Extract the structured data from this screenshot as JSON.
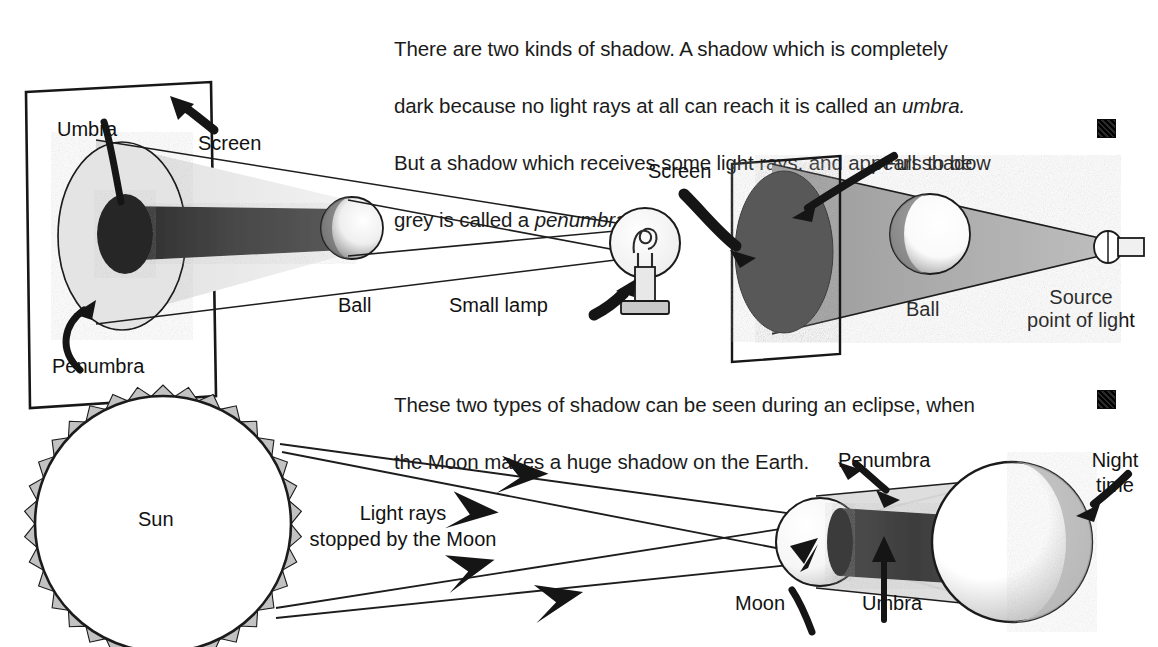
{
  "document": {
    "title": "There are two kinds of shadow — umbra and penumbra",
    "background_color": "#ffffff",
    "ink_color": "#111111"
  },
  "paragraphs": [
    {
      "id": "intro",
      "text": "There are two kinds of shadow. A shadow which is completely\ndark because no light rays at all can reach it is called an umbra.\nBut a shadow which receives some light rays, and appears to be\ngrey is called a penumbra.",
      "italic_terms": [
        "umbra.",
        "penumbra."
      ]
    },
    {
      "id": "eclipse",
      "text": "These two types of shadow can be seen during an eclipse, when\nthe Moon makes a huge shadow on the Earth."
    }
  ],
  "markers": [
    {
      "id": "marker-1",
      "shape": "filled-square"
    },
    {
      "id": "marker-2",
      "shape": "filled-square"
    }
  ],
  "figures": [
    {
      "id": "extended-source-figure",
      "caption_concept": "Extended light source (small lamp) creates umbra and penumbra",
      "labels": {
        "umbra": "Umbra",
        "penumbra": "Penumbra",
        "screen": "Screen",
        "ball": "Ball",
        "lamp": "Small lamp"
      },
      "colors": {
        "penumbra_fill": "#d7d7d7",
        "umbra_fill": "#4c4c4c",
        "umbra_core": "#2b2b2b",
        "ball_fill": "#efefef",
        "outline": "#1a1a1a"
      }
    },
    {
      "id": "point-source-figure",
      "caption_concept": "Point source of light creates only a full (dark) shadow",
      "labels": {
        "screen": "Screen",
        "full_shadow": "Full shadow",
        "ball": "Ball",
        "source": "Source\npoint of light"
      },
      "colors": {
        "cone_fill": "#a9a9a9",
        "shadow_fill": "#5a5a5a",
        "ball_fill": "#f4f4f4",
        "outline": "#1a1a1a"
      }
    },
    {
      "id": "eclipse-figure",
      "caption_concept": "Solar eclipse — Moon casts umbra and penumbra on the Earth",
      "labels": {
        "sun": "Sun",
        "light_rays": "Light rays\nstopped by the Moon",
        "penumbra": "Penumbra",
        "moon": "Moon",
        "umbra": "Umbra",
        "night": "Night\ntime"
      },
      "ray_arrow_count": 4,
      "colors": {
        "sun_outline": "#1a1a1a",
        "sun_corona": "#b4b4b4",
        "penumbra_fill": "#d2d2d2",
        "umbra_fill": "#4a4a4a",
        "earth_night": "#bdbdbd",
        "outline": "#1a1a1a"
      }
    }
  ]
}
